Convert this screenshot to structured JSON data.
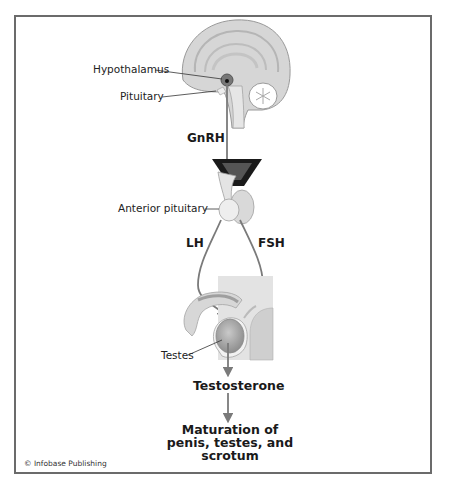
{
  "figure": {
    "type": "hormone-pathway-diagram",
    "labels": {
      "hypothalamus": "Hypothalamus",
      "pituitary": "Pituitary",
      "anterior_pituitary": "Anterior pituitary",
      "testes": "Testes"
    },
    "hormones": {
      "gnrh": "GnRH",
      "lh": "LH",
      "fsh": "FSH",
      "testosterone": "Testosterone"
    },
    "outcome": {
      "line1": "Maturation of",
      "line2": "penis, testes, and",
      "line3": "scrotum"
    },
    "copyright": "© Infobase Publishing",
    "colors": {
      "frame": "#6b6b6b",
      "arrow": "#7a7a7a",
      "tissue": "#c8c8c8",
      "background_panel": "#e3e3e3"
    }
  }
}
